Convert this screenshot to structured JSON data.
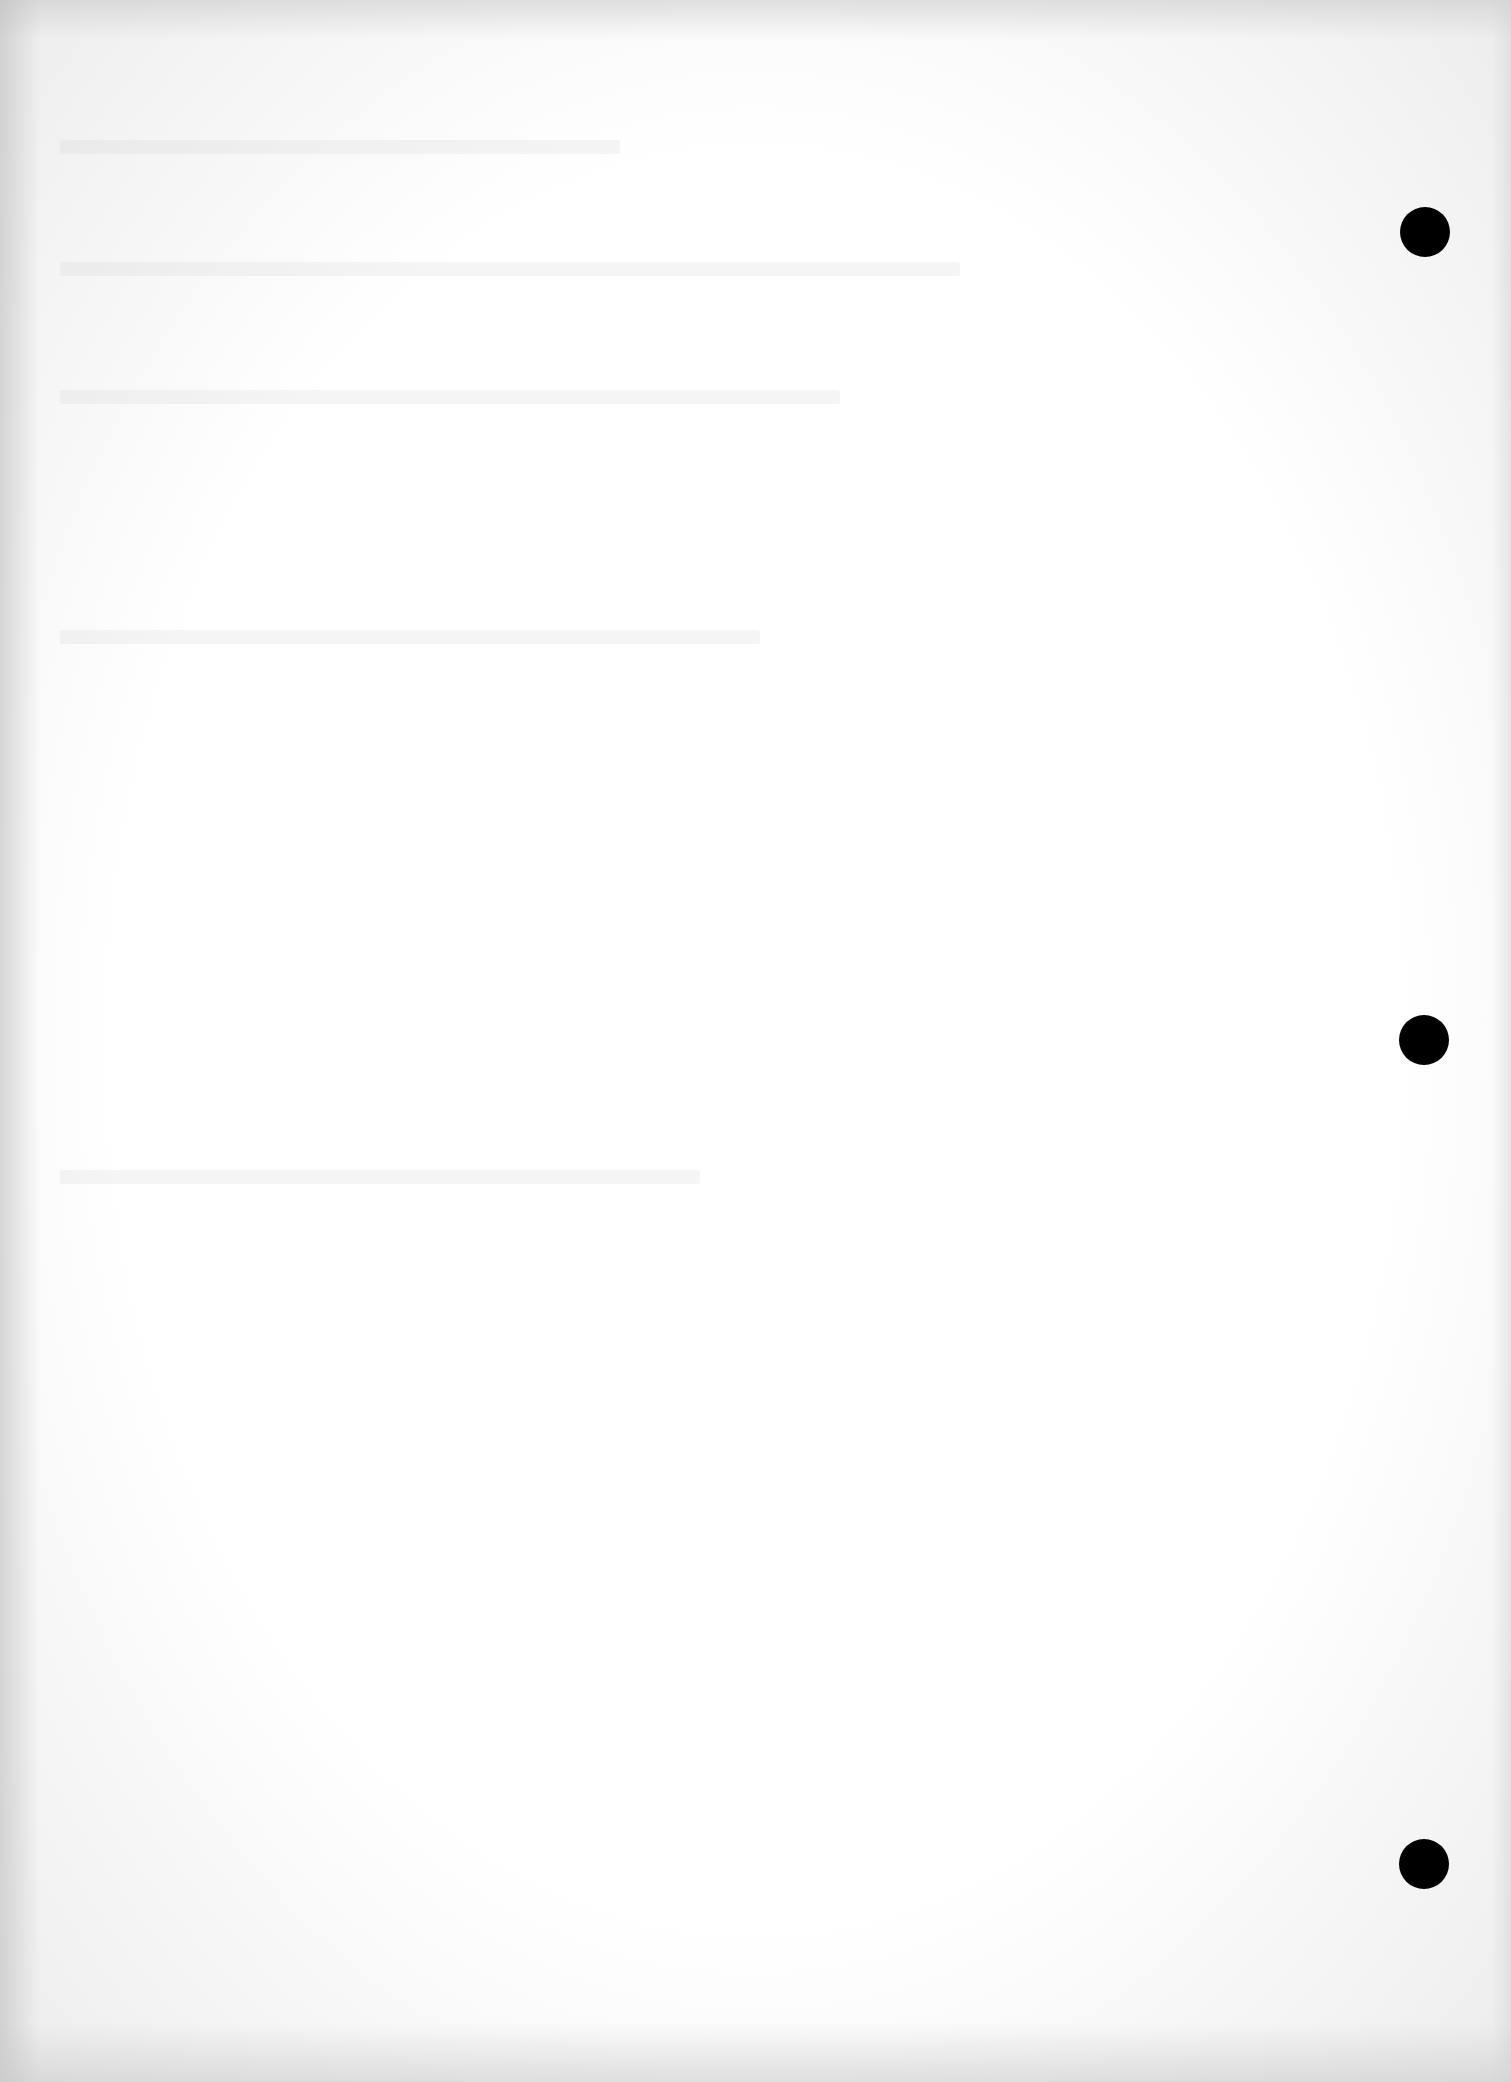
{
  "page": {
    "type": "blank loose-leaf sheet",
    "background_color": "#fbfbfb",
    "text": "",
    "punch_holes": [
      {
        "name": "hole-top",
        "cx": 1425,
        "cy": 232
      },
      {
        "name": "hole-middle",
        "cx": 1424,
        "cy": 1040
      },
      {
        "name": "hole-bottom",
        "cx": 1424,
        "cy": 1864
      }
    ],
    "hole_color": "#000000"
  }
}
